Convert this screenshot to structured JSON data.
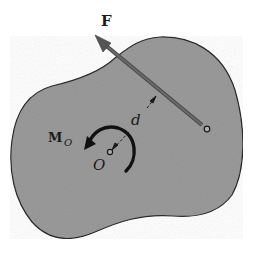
{
  "figure": {
    "labels": {
      "force": "F",
      "moment_main": "M",
      "moment_sub": "O",
      "distance": "d",
      "point": "O"
    },
    "colors": {
      "body_fill": "#9a9a9a",
      "body_stroke": "#2a2a2a",
      "force_vector": "#5a5a5a",
      "ink": "#1a1a1a",
      "background": "#ffffff"
    }
  }
}
